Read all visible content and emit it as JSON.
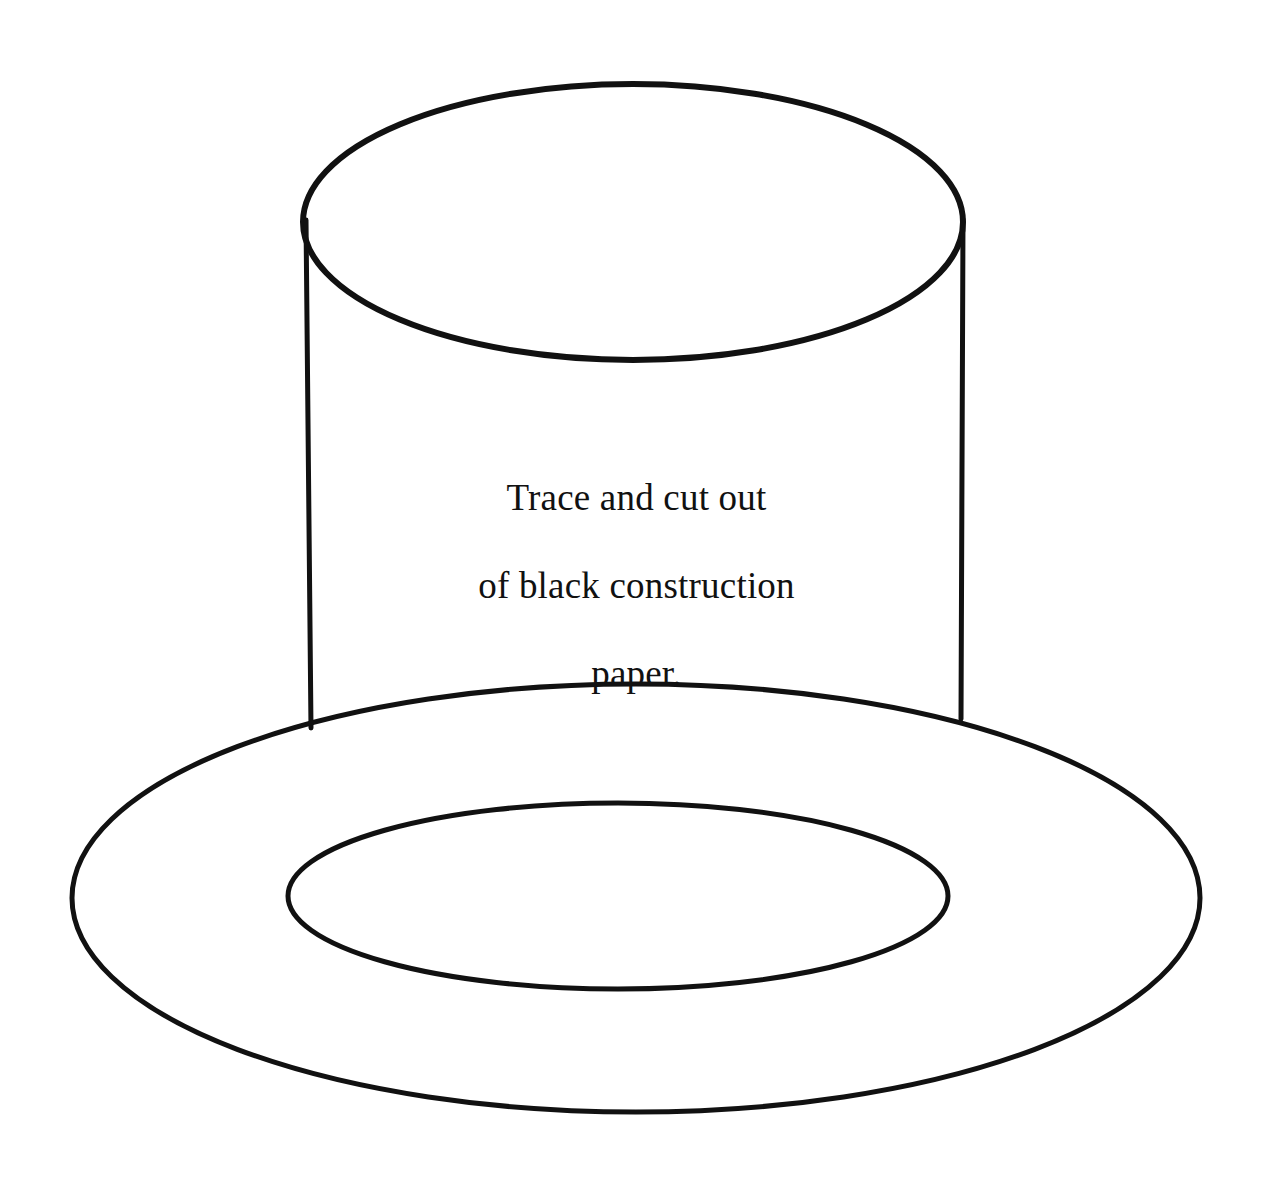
{
  "page": {
    "background_color": "#ffffff",
    "ink_color": "#111111",
    "width": 1273,
    "height": 1196
  },
  "instruction": {
    "full_text": "Trace and cut out of black construction paper.",
    "lines": [
      "Trace and cut out",
      "of black construction",
      "paper."
    ],
    "line1": "Trace and cut out",
    "line2": "of black construction",
    "line3": "paper."
  },
  "diagram": {
    "name": "top-hat-outline",
    "stroke_color": "#111111",
    "fill_color": "none",
    "parts": [
      {
        "name": "crown-top-ellipse",
        "shape": "ellipse",
        "cx": 633,
        "cy": 222,
        "rx": 330,
        "ry": 138,
        "stroke_width": 6
      },
      {
        "name": "crown-left-side",
        "shape": "line",
        "x1": 306,
        "y1": 220,
        "x2": 311,
        "y2": 728,
        "stroke_width": 5
      },
      {
        "name": "crown-right-side",
        "shape": "line",
        "x1": 963,
        "y1": 219,
        "x2": 961,
        "y2": 719,
        "stroke_width": 5
      },
      {
        "name": "brim-outer-ellipse",
        "shape": "ellipse",
        "cx": 636,
        "cy": 898,
        "rx": 564,
        "ry": 214,
        "stroke_width": 5
      },
      {
        "name": "brim-inner-ellipse",
        "shape": "ellipse",
        "cx": 618,
        "cy": 896,
        "rx": 330,
        "ry": 93,
        "stroke_width": 5
      }
    ]
  }
}
